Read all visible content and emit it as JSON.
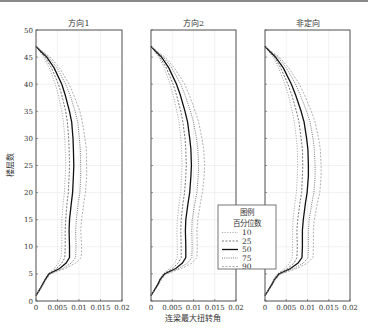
{
  "chart_data": {
    "type": "line",
    "ylabel": "楼层数",
    "xlabel": "连梁最大扭转角",
    "ylim": [
      0,
      50
    ],
    "xlim": [
      0,
      0.02
    ],
    "yticks": [
      0,
      5,
      10,
      15,
      20,
      25,
      30,
      35,
      40,
      45,
      50
    ],
    "xticks": [
      "0",
      "0.005",
      "0.01",
      "0.015",
      "0.02"
    ],
    "grid": true,
    "legend": {
      "title": "图例",
      "subtitle": "百分位数",
      "entries": [
        "10",
        "25",
        "50",
        "75",
        "90"
      ],
      "position": "inside lower right of panel 2 / overlapping panel 3"
    },
    "panels": [
      {
        "title": "方向1",
        "floors": [
          1,
          2,
          3,
          4,
          5,
          6,
          7,
          8,
          10,
          13,
          15,
          18,
          20,
          23,
          25,
          28,
          30,
          33,
          35,
          38,
          40,
          43,
          45,
          46,
          47
        ],
        "series": [
          {
            "name": "10",
            "values": [
              0,
              0.0007,
              0.0013,
              0.002,
              0.0028,
              0.0042,
              0.0052,
              0.0058,
              0.006,
              0.006,
              0.006,
              0.0063,
              0.0066,
              0.0068,
              0.0069,
              0.0068,
              0.0067,
              0.0064,
              0.006,
              0.0052,
              0.0045,
              0.0031,
              0.0018,
              0.0009,
              0
            ]
          },
          {
            "name": "25",
            "values": [
              0,
              0.0007,
              0.0014,
              0.0021,
              0.0029,
              0.0048,
              0.006,
              0.0067,
              0.0068,
              0.0068,
              0.0069,
              0.0072,
              0.0075,
              0.0077,
              0.0078,
              0.0077,
              0.0076,
              0.0073,
              0.0069,
              0.006,
              0.0052,
              0.0036,
              0.0021,
              0.001,
              0
            ]
          },
          {
            "name": "50",
            "values": [
              0,
              0.0008,
              0.0015,
              0.0022,
              0.003,
              0.0055,
              0.007,
              0.0078,
              0.0078,
              0.0077,
              0.0078,
              0.0082,
              0.0085,
              0.0087,
              0.0088,
              0.0087,
              0.0086,
              0.0083,
              0.0078,
              0.0068,
              0.006,
              0.0042,
              0.0025,
              0.0012,
              0
            ]
          },
          {
            "name": "75",
            "values": [
              0,
              0.0008,
              0.0016,
              0.0023,
              0.0032,
              0.0062,
              0.0082,
              0.0092,
              0.0093,
              0.0092,
              0.0094,
              0.0098,
              0.0102,
              0.0104,
              0.0104,
              0.0103,
              0.0101,
              0.0097,
              0.0091,
              0.0079,
              0.0069,
              0.0049,
              0.0029,
              0.0014,
              0
            ]
          },
          {
            "name": "90",
            "values": [
              0,
              0.0009,
              0.0017,
              0.0024,
              0.0034,
              0.0068,
              0.0092,
              0.0105,
              0.0106,
              0.0104,
              0.0106,
              0.0111,
              0.0115,
              0.0118,
              0.0118,
              0.0117,
              0.0114,
              0.0108,
              0.0102,
              0.0088,
              0.0077,
              0.0055,
              0.0033,
              0.0016,
              0
            ]
          }
        ]
      },
      {
        "title": "方向2",
        "floors": [
          1,
          2,
          3,
          4,
          5,
          6,
          7,
          8,
          10,
          13,
          15,
          18,
          20,
          23,
          25,
          28,
          30,
          33,
          35,
          38,
          40,
          43,
          45,
          46,
          47
        ],
        "series": [
          {
            "name": "10",
            "values": [
              0,
              0.0007,
              0.0014,
              0.002,
              0.0028,
              0.0044,
              0.0056,
              0.0062,
              0.0062,
              0.0061,
              0.0062,
              0.0066,
              0.007,
              0.0072,
              0.0073,
              0.0072,
              0.007,
              0.0066,
              0.0061,
              0.0052,
              0.0045,
              0.0031,
              0.0018,
              0.0009,
              0
            ]
          },
          {
            "name": "25",
            "values": [
              0,
              0.0008,
              0.0015,
              0.0021,
              0.003,
              0.005,
              0.0064,
              0.0071,
              0.0071,
              0.007,
              0.0071,
              0.0075,
              0.0079,
              0.0082,
              0.0083,
              0.0082,
              0.008,
              0.0075,
              0.007,
              0.006,
              0.0052,
              0.0036,
              0.0021,
              0.001,
              0
            ]
          },
          {
            "name": "50",
            "values": [
              0,
              0.0008,
              0.0016,
              0.0022,
              0.0032,
              0.0058,
              0.0074,
              0.0082,
              0.0082,
              0.0081,
              0.0082,
              0.0087,
              0.0091,
              0.0094,
              0.0095,
              0.0094,
              0.0091,
              0.0086,
              0.008,
              0.0069,
              0.006,
              0.0042,
              0.0025,
              0.0012,
              0
            ]
          },
          {
            "name": "75",
            "values": [
              0,
              0.0009,
              0.0017,
              0.0023,
              0.0034,
              0.0065,
              0.0086,
              0.0096,
              0.0097,
              0.0096,
              0.0097,
              0.0103,
              0.0108,
              0.0111,
              0.0112,
              0.011,
              0.0107,
              0.01,
              0.0093,
              0.008,
              0.007,
              0.0049,
              0.0029,
              0.0014,
              0
            ]
          },
          {
            "name": "90",
            "values": [
              0,
              0.0009,
              0.0018,
              0.0025,
              0.0036,
              0.0072,
              0.0096,
              0.0108,
              0.0109,
              0.0108,
              0.011,
              0.0116,
              0.0121,
              0.0125,
              0.0126,
              0.0124,
              0.012,
              0.0112,
              0.0104,
              0.009,
              0.0079,
              0.0055,
              0.0033,
              0.0016,
              0
            ]
          }
        ]
      },
      {
        "title": "非定向",
        "floors": [
          1,
          2,
          3,
          4,
          5,
          6,
          7,
          8,
          10,
          13,
          15,
          18,
          20,
          23,
          25,
          28,
          30,
          33,
          35,
          38,
          40,
          43,
          45,
          46,
          47
        ],
        "series": [
          {
            "name": "10",
            "values": [
              0,
              0.0007,
              0.0014,
              0.002,
              0.0029,
              0.0046,
              0.0058,
              0.0064,
              0.0065,
              0.0065,
              0.0066,
              0.007,
              0.0074,
              0.0076,
              0.0077,
              0.0076,
              0.0074,
              0.0069,
              0.0064,
              0.0055,
              0.0047,
              0.0032,
              0.0019,
              0.0009,
              0
            ]
          },
          {
            "name": "25",
            "values": [
              0,
              0.0008,
              0.0015,
              0.0021,
              0.0031,
              0.0053,
              0.0068,
              0.0075,
              0.0076,
              0.0075,
              0.0077,
              0.0082,
              0.0086,
              0.0088,
              0.0089,
              0.0088,
              0.0085,
              0.008,
              0.0074,
              0.0063,
              0.0054,
              0.0037,
              0.0022,
              0.0011,
              0
            ]
          },
          {
            "name": "50",
            "values": [
              0,
              0.0008,
              0.0016,
              0.0023,
              0.0033,
              0.006,
              0.0078,
              0.0087,
              0.0088,
              0.0088,
              0.009,
              0.0095,
              0.0099,
              0.0102,
              0.0102,
              0.0101,
              0.0098,
              0.0092,
              0.0085,
              0.0072,
              0.0062,
              0.0043,
              0.0025,
              0.0012,
              0
            ]
          },
          {
            "name": "75",
            "values": [
              0,
              0.0009,
              0.0017,
              0.0024,
              0.0035,
              0.0068,
              0.009,
              0.0101,
              0.0102,
              0.0102,
              0.0104,
              0.011,
              0.0115,
              0.0118,
              0.0118,
              0.0116,
              0.0113,
              0.0106,
              0.0098,
              0.0083,
              0.0072,
              0.005,
              0.003,
              0.0014,
              0
            ]
          },
          {
            "name": "90",
            "values": [
              0,
              0.0009,
              0.0018,
              0.0025,
              0.0037,
              0.0075,
              0.01,
              0.0113,
              0.0114,
              0.0114,
              0.0116,
              0.0123,
              0.0129,
              0.0132,
              0.0132,
              0.013,
              0.0126,
              0.0118,
              0.0109,
              0.0093,
              0.0081,
              0.0056,
              0.0034,
              0.0016,
              0
            ]
          }
        ]
      }
    ]
  },
  "ui": {
    "panel_titles": [
      "方向1",
      "方向2",
      "非定向"
    ],
    "ylabel": "楼层数",
    "xlabel": "连梁最大扭转角",
    "legend_title": "图例",
    "legend_subtitle": "百分位数",
    "legend_entries": [
      "10",
      "25",
      "50",
      "75",
      "90"
    ],
    "colors": {
      "p10": "#9a9a9a",
      "p25": "#555555",
      "p50": "#111111",
      "p75": "#555555",
      "p90": "#9a9a9a",
      "axis": "#555555",
      "grid": "#e4e4e4"
    }
  }
}
